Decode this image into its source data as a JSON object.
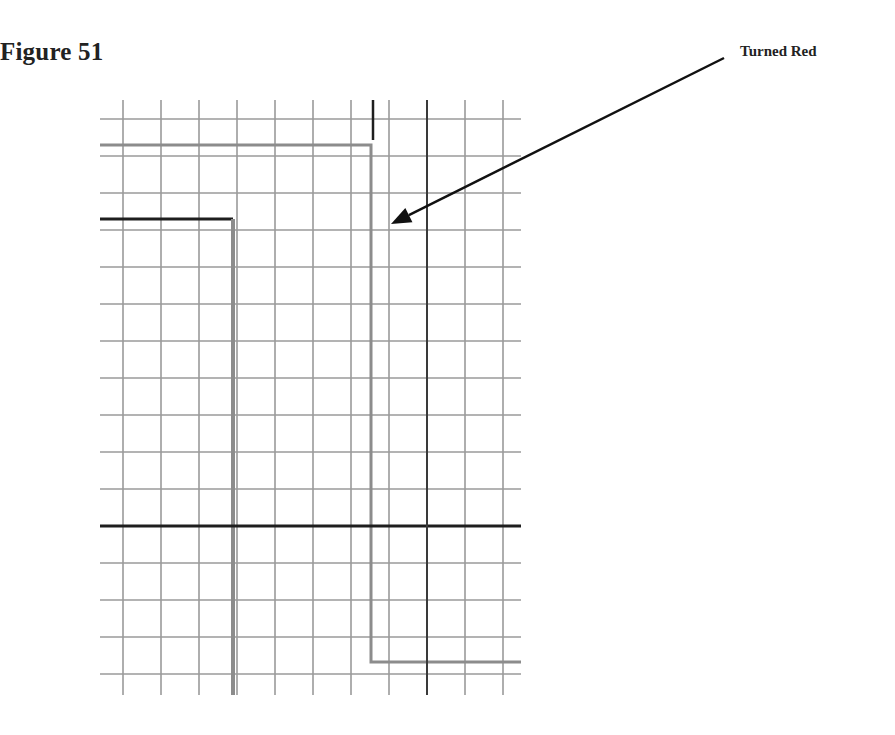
{
  "figure": {
    "title": "Figure 51",
    "annotation": "Turned Red"
  },
  "colors": {
    "grid": "#9a9a9a",
    "dark_line": "#1e1e1e",
    "gray_signal": "#8c8c8c",
    "text": "#222222"
  },
  "grid": {
    "x_left": 100,
    "x_right": 521,
    "y_top": 100,
    "y_bottom": 695,
    "vertical_lines_x": [
      123,
      161,
      199,
      237,
      275,
      313,
      351,
      389,
      427,
      465,
      503
    ],
    "horizontal_lines_y": [
      119,
      156,
      193,
      230,
      267,
      304,
      341,
      378,
      415,
      452,
      489,
      526,
      563,
      600,
      637,
      674
    ]
  },
  "traces": [
    {
      "name": "upper-gray-trace",
      "points": [
        [
          100,
          145
        ],
        [
          371,
          145
        ],
        [
          371,
          662
        ],
        [
          521,
          662
        ]
      ],
      "color": "#8c8c8c",
      "width": 3
    },
    {
      "name": "left-dark-trace",
      "points": [
        [
          100,
          219
        ],
        [
          233,
          219
        ]
      ],
      "color": "#1e1e1e",
      "width": 3
    },
    {
      "name": "left-gray-drop",
      "points": [
        [
          233,
          219
        ],
        [
          233,
          695
        ]
      ],
      "color": "#8c8c8c",
      "width": 4
    },
    {
      "name": "center-dark-horizontal",
      "points": [
        [
          100,
          526
        ],
        [
          521,
          526
        ]
      ],
      "color": "#1e1e1e",
      "width": 3
    },
    {
      "name": "right-dark-vertical",
      "points": [
        [
          427,
          100
        ],
        [
          427,
          695
        ]
      ],
      "color": "#3a3a3a",
      "width": 2
    },
    {
      "name": "top-dark-tick",
      "points": [
        [
          373,
          100
        ],
        [
          373,
          140
        ]
      ],
      "color": "#1e1e1e",
      "width": 2.5
    }
  ],
  "arrow": {
    "from": [
      724,
      58
    ],
    "to": [
      391,
      224
    ]
  }
}
